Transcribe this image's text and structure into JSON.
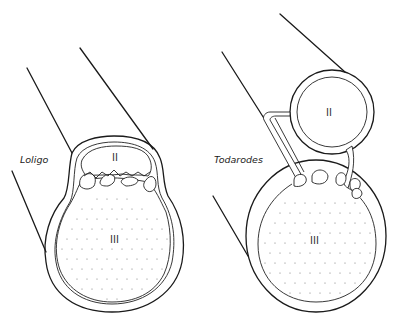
{
  "figure": {
    "left_panel": {
      "species_label": "Loligo",
      "region_upper_label": "II",
      "region_lower_label": "III"
    },
    "right_panel": {
      "species_label": "Todarodes",
      "region_upper_label": "II",
      "region_lower_label": "III"
    },
    "colors": {
      "line": "#1a1a1a",
      "background": "#ffffff",
      "stipple": "#777777"
    }
  }
}
